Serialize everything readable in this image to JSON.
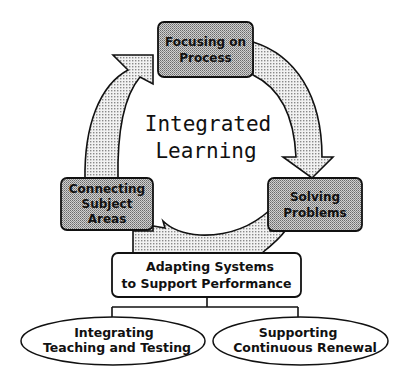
{
  "diagram": {
    "center_label": {
      "line1": "Integrated",
      "line2": "Learning"
    },
    "cycle_boxes": [
      {
        "id": "top",
        "line1": "Focusing on",
        "line2": "Process"
      },
      {
        "id": "right",
        "line1": "Solving",
        "line2": "Problems"
      },
      {
        "id": "left",
        "line1": "Connecting",
        "line2": "Subject",
        "line3": "Areas"
      }
    ],
    "support_box": {
      "line1": "Adapting Systems",
      "line2": "to Support Performance"
    },
    "ellipses": [
      {
        "line1": "Integrating",
        "line2": "Teaching and Testing"
      },
      {
        "line1": "Supporting",
        "line2": "Continuous Renewal"
      }
    ],
    "colors": {
      "box_fill": "#b4b4b4",
      "arrow_fill": "#d9d9d9",
      "stroke": "#111111",
      "background": "#ffffff"
    }
  }
}
